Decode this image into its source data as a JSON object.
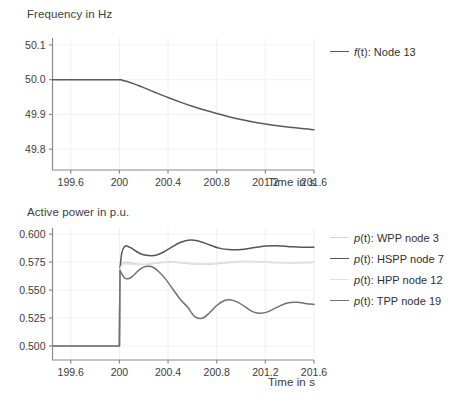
{
  "figure": {
    "title": "",
    "panels": [
      {
        "id": "frequency",
        "ylabel": "Frequency in Hz",
        "xlabel": "Time in s"
      },
      {
        "id": "power",
        "ylabel": "Active power in p.u.",
        "xlabel": "Time in s"
      }
    ]
  },
  "chart_data": [
    {
      "type": "line",
      "title": "",
      "xlabel": "Time in s",
      "ylabel": "Frequency in Hz",
      "xlim": [
        199.45,
        201.6
      ],
      "ylim": [
        49.74,
        50.12
      ],
      "xticks": [
        "199.6",
        "200",
        "200.4",
        "200.8",
        "201.2",
        "201.6"
      ],
      "xtick_values": [
        199.6,
        200,
        200.4,
        200.8,
        201.2,
        201.6
      ],
      "yticks": [
        "50.1",
        "50.0",
        "49.9",
        "49.8"
      ],
      "ytick_values": [
        50.1,
        50.0,
        49.9,
        49.8
      ],
      "grid": true,
      "legend_position": "right",
      "series": [
        {
          "name": "f(t): Node 13",
          "symbol": "f",
          "node": "Node 13",
          "color": "#5a5a5a",
          "x": [
            199.45,
            199.6,
            199.8,
            200.0,
            200.02,
            200.05,
            200.1,
            200.15,
            200.2,
            200.3,
            200.4,
            200.5,
            200.6,
            200.7,
            200.8,
            200.9,
            201.0,
            201.1,
            201.2,
            201.3,
            201.4,
            201.5,
            201.6
          ],
          "y": [
            50.0,
            50.0,
            50.0,
            50.0,
            49.9985,
            49.996,
            49.9905,
            49.984,
            49.977,
            49.9625,
            49.9485,
            49.9355,
            49.9235,
            49.9125,
            49.9025,
            49.8935,
            49.8855,
            49.8785,
            49.8725,
            49.8672,
            49.8628,
            49.8592,
            49.8562
          ]
        }
      ]
    },
    {
      "type": "line",
      "title": "",
      "xlabel": "Time in s",
      "ylabel": "Active power in p.u.",
      "xlim": [
        199.45,
        201.6
      ],
      "ylim": [
        0.4875,
        0.6055
      ],
      "xticks": [
        "199.6",
        "200",
        "200.4",
        "200.8",
        "201.2",
        "201.6"
      ],
      "xtick_values": [
        199.6,
        200,
        200.4,
        200.8,
        201.2,
        201.6
      ],
      "yticks": [
        "0.600",
        "0.575",
        "0.550",
        "0.525",
        "0.500"
      ],
      "ytick_values": [
        0.6,
        0.575,
        0.55,
        0.525,
        0.5
      ],
      "grid": true,
      "legend_position": "right",
      "series": [
        {
          "name": "p(t): WPP node 3",
          "symbol": "p",
          "node": "WPP node 3",
          "color": "#d5d5d5",
          "x": [
            199.45,
            199.8,
            200.0,
            200.005,
            200.02,
            200.05,
            200.1,
            200.15,
            200.2,
            200.25,
            200.3,
            200.35,
            200.4,
            200.45,
            200.5,
            200.6,
            200.7,
            200.8,
            200.9,
            201.0,
            201.1,
            201.2,
            201.3,
            201.4,
            201.5,
            201.6
          ],
          "y": [
            0.5,
            0.5,
            0.5,
            0.569,
            0.5735,
            0.5748,
            0.5742,
            0.5732,
            0.5728,
            0.5732,
            0.574,
            0.5748,
            0.5752,
            0.575,
            0.5744,
            0.5733,
            0.573,
            0.5736,
            0.5746,
            0.5754,
            0.5756,
            0.5752,
            0.5746,
            0.5743,
            0.5744,
            0.5748
          ]
        },
        {
          "name": "p(t): HSPP node 7",
          "symbol": "p",
          "node": "HSPP node 7",
          "color": "#555555",
          "x": [
            199.45,
            199.8,
            200.0,
            200.005,
            200.02,
            200.04,
            200.06,
            200.1,
            200.14,
            200.18,
            200.22,
            200.26,
            200.3,
            200.36,
            200.42,
            200.5,
            200.58,
            200.66,
            200.74,
            200.82,
            200.9,
            201.0,
            201.1,
            201.2,
            201.3,
            201.4,
            201.5,
            201.6
          ],
          "y": [
            0.5,
            0.5,
            0.5,
            0.5695,
            0.5835,
            0.5885,
            0.5895,
            0.5875,
            0.5845,
            0.5823,
            0.5812,
            0.5808,
            0.5812,
            0.5838,
            0.5878,
            0.5925,
            0.5948,
            0.5935,
            0.5905,
            0.5875,
            0.5862,
            0.5862,
            0.5878,
            0.5893,
            0.5896,
            0.5888,
            0.5882,
            0.5884
          ]
        },
        {
          "name": "p(t): HPP node 12",
          "symbol": "p",
          "node": "HPP node 12",
          "color": "#e2e2e2",
          "x": [
            199.45,
            199.8,
            200.0,
            200.005,
            200.02,
            200.05,
            200.1,
            200.15,
            200.2,
            200.3,
            200.4,
            200.5,
            200.6,
            200.7,
            200.8,
            200.9,
            201.0,
            201.1,
            201.2,
            201.3,
            201.4,
            201.5,
            201.6
          ],
          "y": [
            0.5,
            0.5,
            0.5,
            0.5688,
            0.5722,
            0.5735,
            0.5733,
            0.5729,
            0.573,
            0.5742,
            0.5752,
            0.5748,
            0.5738,
            0.5734,
            0.5741,
            0.5752,
            0.5757,
            0.5754,
            0.5748,
            0.5744,
            0.5744,
            0.5747,
            0.5749
          ]
        },
        {
          "name": "p(t): TPP node 19",
          "symbol": "p",
          "node": "TPP node 19",
          "color": "#707070",
          "x": [
            199.45,
            199.8,
            200.0,
            200.005,
            200.02,
            200.04,
            200.06,
            200.09,
            200.12,
            200.16,
            200.2,
            200.24,
            200.28,
            200.32,
            200.38,
            200.44,
            200.5,
            200.56,
            200.62,
            200.68,
            200.74,
            200.8,
            200.86,
            200.92,
            200.98,
            201.04,
            201.1,
            201.16,
            201.22,
            201.3,
            201.38,
            201.46,
            201.54,
            201.6
          ],
          "y": [
            0.5,
            0.5,
            0.5,
            0.5675,
            0.5645,
            0.5612,
            0.5602,
            0.5608,
            0.5635,
            0.5678,
            0.5705,
            0.5712,
            0.5702,
            0.5668,
            0.5598,
            0.5508,
            0.5418,
            0.5348,
            0.5262,
            0.5248,
            0.5295,
            0.5362,
            0.5405,
            0.5412,
            0.5388,
            0.5345,
            0.5305,
            0.5292,
            0.5305,
            0.5348,
            0.5385,
            0.5392,
            0.5378,
            0.5372
          ]
        }
      ]
    }
  ]
}
